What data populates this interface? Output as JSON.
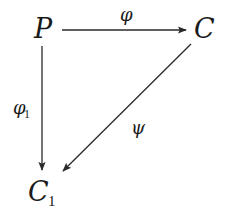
{
  "diagram": {
    "type": "commutative-triangle",
    "nodes": {
      "P": {
        "label": "P"
      },
      "C": {
        "label": "C"
      },
      "C1": {
        "label": "C",
        "subscript": "1"
      }
    },
    "edges": {
      "phi": {
        "from": "P",
        "to": "C",
        "label": "φ"
      },
      "phi1": {
        "from": "P",
        "to": "C1",
        "label": "φ",
        "subscript": "1"
      },
      "psi": {
        "from": "C",
        "to": "C1",
        "label": "ψ"
      }
    },
    "colors": {
      "ink": "#1a1a1a",
      "background": "#ffffff"
    }
  }
}
